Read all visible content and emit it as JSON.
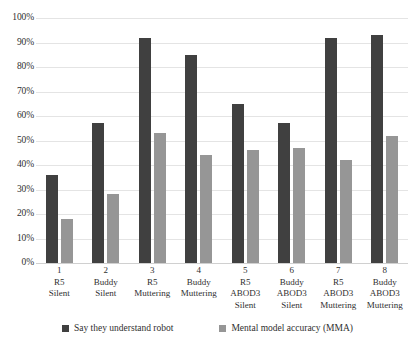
{
  "chart_data": {
    "type": "bar",
    "title": "",
    "subtitle": "",
    "xlabel": "",
    "ylabel": "",
    "ylim": [
      0,
      100
    ],
    "y_unit": "%",
    "grid": true,
    "legend_position": "bottom",
    "y_ticks": [
      "0%",
      "10%",
      "20%",
      "30%",
      "40%",
      "50%",
      "60%",
      "70%",
      "80%",
      "90%",
      "100%"
    ],
    "y_tick_values": [
      0,
      10,
      20,
      30,
      40,
      50,
      60,
      70,
      80,
      90,
      100
    ],
    "categories": [
      {
        "num": "1",
        "line1": "R5",
        "line2": "Silent",
        "line3": ""
      },
      {
        "num": "2",
        "line1": "Buddy",
        "line2": "Silent",
        "line3": ""
      },
      {
        "num": "3",
        "line1": "R5",
        "line2": "Muttering",
        "line3": ""
      },
      {
        "num": "4",
        "line1": "Buddy",
        "line2": "Muttering",
        "line3": ""
      },
      {
        "num": "5",
        "line1": "R5",
        "line2": "ABOD3",
        "line3": "Silent"
      },
      {
        "num": "6",
        "line1": "Buddy",
        "line2": "ABOD3",
        "line3": "Silent"
      },
      {
        "num": "7",
        "line1": "R5",
        "line2": "ABOD3",
        "line3": "Muttering"
      },
      {
        "num": "8",
        "line1": "Buddy",
        "line2": "ABOD3",
        "line3": "Muttering"
      }
    ],
    "series": [
      {
        "name": "Say they understand robot",
        "color": "#404040",
        "values": [
          36,
          57,
          92,
          85,
          65,
          57,
          92,
          93
        ]
      },
      {
        "name": "Mental model accuracy (MMA)",
        "color": "#969696",
        "values": [
          18,
          28,
          53,
          44,
          46,
          47,
          42,
          52
        ]
      }
    ]
  }
}
